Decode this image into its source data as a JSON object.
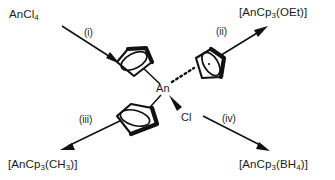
{
  "scheme": {
    "title": "Synthesis routes from AnCl4 via AnCp3Cl",
    "reactant": {
      "name": "actinide-tetrachloride",
      "formula": "AnCl",
      "formula_sub": "4"
    },
    "center": {
      "metal_label": "An",
      "chloride_label": "Cl",
      "ring_count": 3,
      "ring_name": "cyclopentadienyl"
    },
    "conditions": [
      {
        "id": "i",
        "label": "(i)"
      },
      {
        "id": "ii",
        "label": "(ii)"
      },
      {
        "id": "iii",
        "label": "(iii)"
      },
      {
        "id": "iv",
        "label": "(iv)"
      }
    ],
    "products": [
      {
        "id": "oet",
        "prefix": "[AnCp",
        "sub1": "3",
        "mid": "(OEt)]",
        "sub2": "",
        "suffix": ""
      },
      {
        "id": "ch3",
        "prefix": "[AnCp",
        "sub1": "3",
        "mid": "(CH",
        "sub2": "3",
        "suffix": ")]"
      },
      {
        "id": "bh4",
        "prefix": "[AnCp",
        "sub1": "3",
        "mid": "(BH",
        "sub2": "4",
        "suffix": ")]"
      }
    ],
    "colors": {
      "ink": "#111111",
      "background": "#ffffff"
    }
  }
}
